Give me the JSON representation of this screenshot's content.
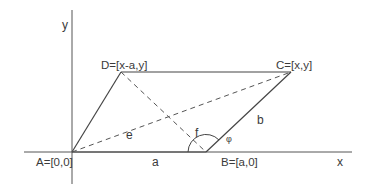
{
  "diagram": {
    "colors": {
      "line": "#444444",
      "text": "#3a3a3a",
      "background": "#ffffff"
    },
    "axes": {
      "x_label": "x",
      "y_label": "y"
    },
    "points": {
      "A": {
        "label": "A=[0,0]"
      },
      "B": {
        "label": "B=[a,0]"
      },
      "C": {
        "label": "C=[x,y]"
      },
      "D": {
        "label": "D=[x-a,y]"
      }
    },
    "sides": {
      "a": "a",
      "b": "b"
    },
    "diagonals": {
      "e": "e",
      "f": "f"
    },
    "angle": {
      "symbol": "φ",
      "at": "B"
    }
  }
}
